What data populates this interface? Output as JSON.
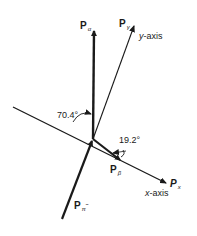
{
  "diagram": {
    "type": "momentum-vector-diagram",
    "vectors": [
      {
        "id": "p_alpha",
        "label": "P",
        "subscript": "α"
      },
      {
        "id": "p_gamma",
        "label": "P",
        "subscript": "γ"
      },
      {
        "id": "p_beta",
        "label": "P",
        "subscript": "β"
      },
      {
        "id": "p_pi_minus",
        "label": "P",
        "subscript": "π",
        "superscript": "−"
      }
    ],
    "axes": {
      "y_axis_label": "y-axis",
      "x_axis_label": "x-axis",
      "px_label": "P",
      "px_subscript": "x"
    },
    "angles": {
      "angle_1": "70.4°",
      "angle_2": "19.2°"
    },
    "colors": {
      "ink": "#1a1a1a",
      "background": "#ffffff"
    }
  }
}
